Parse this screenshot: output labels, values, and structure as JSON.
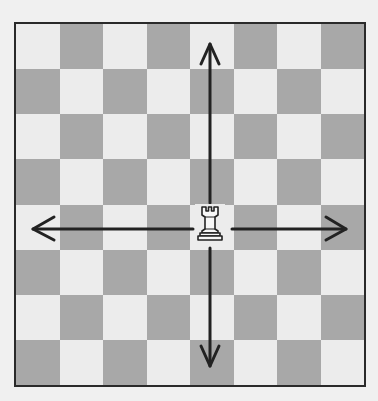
{
  "diagram": {
    "board": {
      "files": 8,
      "ranks": 8,
      "top_left_color": "light",
      "colors": {
        "light": "#ececec",
        "dark": "#a8a8a8",
        "border": "#2a2a2a"
      }
    },
    "piece": {
      "type": "rook",
      "color": "white",
      "square": {
        "col": 4,
        "row": 4
      },
      "glyph": "♖"
    },
    "arrows": [
      {
        "direction": "up",
        "label": "up-arrow"
      },
      {
        "direction": "down",
        "label": "down-arrow"
      },
      {
        "direction": "left",
        "label": "left-arrow"
      },
      {
        "direction": "right",
        "label": "right-arrow"
      }
    ]
  }
}
